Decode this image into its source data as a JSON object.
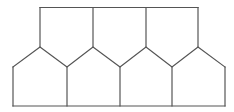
{
  "diagram": {
    "stroke_color": "#555555",
    "background": "#ffffff",
    "top_row": {
      "count": 3,
      "top_y": 7.5,
      "vertical_xs": [
        40,
        93,
        146,
        198
      ]
    },
    "bottom_row": {
      "count": 4,
      "shoulder_y": 67,
      "bottom_y": 106,
      "vertical_xs": [
        13,
        67,
        120,
        172,
        225
      ]
    },
    "zigzag_points": [
      [
        13,
        67
      ],
      [
        40,
        47
      ],
      [
        67,
        67
      ],
      [
        93,
        47
      ],
      [
        120,
        67
      ],
      [
        146,
        47
      ],
      [
        172,
        67
      ],
      [
        198,
        47
      ],
      [
        225,
        67
      ]
    ]
  }
}
